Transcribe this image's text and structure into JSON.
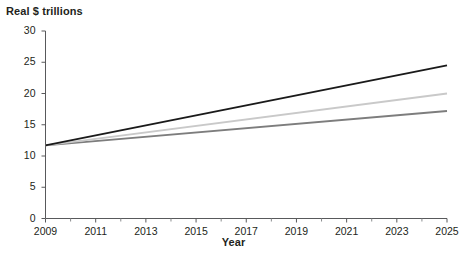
{
  "chart_data": {
    "type": "line",
    "title": "",
    "ylabel": "Real $ trillions",
    "xlabel": "Year",
    "xlim": [
      2009,
      2025
    ],
    "ylim": [
      0,
      30
    ],
    "ytick_values": [
      0,
      5,
      10,
      15,
      20,
      25,
      30
    ],
    "ytick_labels": [
      "0",
      "5",
      "10",
      "15",
      "20",
      "25",
      "30"
    ],
    "xtick_values": [
      2009,
      2011,
      2013,
      2015,
      2017,
      2019,
      2021,
      2023,
      2025
    ],
    "xtick_labels": [
      "2009",
      "2011",
      "2013",
      "2015",
      "2017",
      "2019",
      "2021",
      "2023",
      "2025"
    ],
    "xtick_minor_values": [
      2010,
      2012,
      2014,
      2016,
      2018,
      2020,
      2022,
      2024
    ],
    "grid": false,
    "legend": "none",
    "x": [
      2009,
      2025
    ],
    "series": [
      {
        "name": "high-projection",
        "color": "#1a1a1a",
        "linewidth": 2.0,
        "values": [
          11.7,
          24.5
        ]
      },
      {
        "name": "middle-projection",
        "color": "#c9c9c9",
        "linewidth": 2.0,
        "values": [
          11.7,
          20.0
        ]
      },
      {
        "name": "low-projection",
        "color": "#7d7d7d",
        "linewidth": 2.0,
        "values": [
          11.7,
          17.2
        ]
      }
    ]
  },
  "axes": {
    "y_axis_name": "y-axis",
    "x_axis_name": "x-axis"
  }
}
